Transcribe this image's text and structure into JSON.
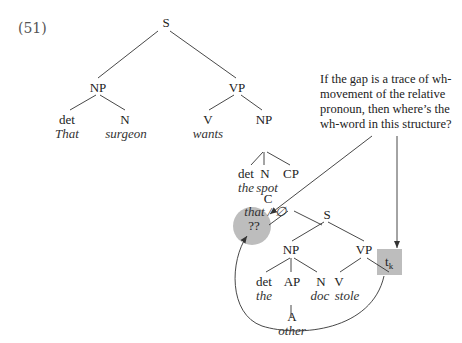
{
  "example_number": "(51)",
  "tree": {
    "root": "S",
    "subject_np": {
      "label": "NP",
      "det": {
        "cat": "det",
        "word": "That"
      },
      "n": {
        "cat": "N",
        "word": "surgeon"
      }
    },
    "vp": {
      "label": "VP",
      "v": {
        "cat": "V",
        "word": "wants"
      },
      "np": {
        "label": "NP",
        "det": {
          "cat": "det",
          "word": "the"
        },
        "n": {
          "cat": "N",
          "word": "spot"
        },
        "cp": {
          "label": "CP",
          "c": {
            "cat": "C",
            "word": "that / ∅"
          },
          "s": {
            "label": "S",
            "np": {
              "label": "NP",
              "det": {
                "cat": "det",
                "word": "the"
              },
              "ap": {
                "label": "AP",
                "a": {
                  "cat": "A",
                  "word": "other"
                }
              },
              "n": {
                "cat": "N",
                "word": "doc"
              }
            },
            "vp": {
              "label": "VP",
              "v": {
                "cat": "V",
                "word": "stole"
              },
              "trace": "t",
              "trace_sub": "k"
            }
          }
        }
      }
    }
  },
  "question_node": "??",
  "annotation": {
    "lines": [
      "If the gap is a trace of wh-",
      "movement of the relative",
      "pronoun, then where’s the",
      "wh-word in this structure?"
    ]
  },
  "colors": {
    "highlight": "#bdbdbd",
    "line": "#333333"
  }
}
